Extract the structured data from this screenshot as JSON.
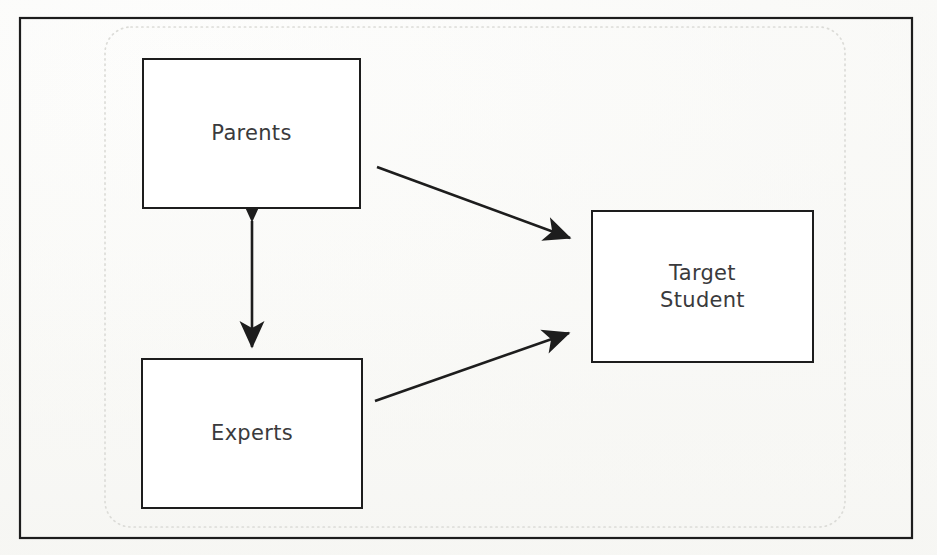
{
  "figure": {
    "type": "block-diagram",
    "background_color": "#fcfcfb",
    "stroke_color": "#1d1d1d",
    "text_color": "#3a3a3c",
    "dotted_boundary_color": "#d8d8d4"
  },
  "outer_frame": {
    "name": "outer-frame",
    "x": 19,
    "y": 17,
    "width": 894,
    "height": 522,
    "stroke": "#1d1d1d",
    "stroke_width": 2
  },
  "dotted_boundary": {
    "name": "dotted-rounded-boundary",
    "x": 105,
    "y": 27,
    "width": 740,
    "height": 500,
    "radius": 26,
    "stroke": "#d8d8d4",
    "stroke_width": 1.6,
    "dash": "1 4"
  },
  "nodes": [
    {
      "id": "parents",
      "label": "Parents",
      "x": 142,
      "y": 58,
      "width": 219,
      "height": 151
    },
    {
      "id": "experts",
      "label": "Experts",
      "x": 141,
      "y": 358,
      "width": 222,
      "height": 151
    },
    {
      "id": "target-student",
      "label": "Target\nStudent",
      "x": 591,
      "y": 210,
      "width": 223,
      "height": 153
    }
  ],
  "edges": [
    {
      "id": "parents-to-target",
      "from": "parents",
      "to": "target-student",
      "arrowheads": "end",
      "x1": 377,
      "y1": 167,
      "x2": 578,
      "y2": 242
    },
    {
      "id": "experts-to-target",
      "from": "experts",
      "to": "target-student",
      "arrowheads": "end",
      "x1": 375,
      "y1": 401,
      "x2": 578,
      "y2": 330
    },
    {
      "id": "parents-experts-bidirectional",
      "from": "parents",
      "to": "experts",
      "arrowheads": "both",
      "x1": 252,
      "y1": 211,
      "x2": 252,
      "y2": 356
    }
  ]
}
